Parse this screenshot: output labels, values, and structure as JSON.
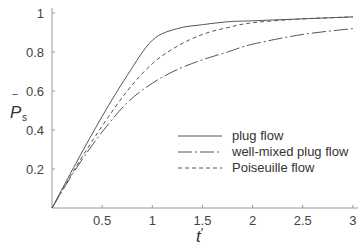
{
  "chart_data": {
    "type": "line",
    "title": "",
    "xlabel": "t'",
    "ylabel": "P̄s",
    "xlim": [
      0,
      3
    ],
    "ylim": [
      0,
      1
    ],
    "xticks": [
      0.5,
      1,
      1.5,
      2,
      2.5,
      3
    ],
    "yticks": [
      0.2,
      0.4,
      0.6,
      0.8,
      1
    ],
    "xtick_labels": [
      "0.5",
      "1",
      "1.5",
      "2",
      "2.5",
      "3"
    ],
    "ytick_labels": [
      "0.2",
      "0.4",
      "0.6",
      "0.8",
      "1"
    ],
    "grid": false,
    "legend_position": "center-right",
    "x": [
      0,
      0.25,
      0.5,
      0.75,
      1.0,
      1.25,
      1.5,
      1.75,
      2.0,
      2.5,
      3.0
    ],
    "series": [
      {
        "name": "plug flow",
        "style": "solid",
        "values": [
          0,
          0.24,
          0.47,
          0.68,
          0.86,
          0.92,
          0.94,
          0.955,
          0.96,
          0.97,
          0.98
        ]
      },
      {
        "name": "well-mixed plug flow",
        "style": "dash-dot",
        "values": [
          0,
          0.21,
          0.39,
          0.54,
          0.64,
          0.71,
          0.76,
          0.8,
          0.84,
          0.89,
          0.92
        ]
      },
      {
        "name": "Poiseuille flow",
        "style": "dashed",
        "values": [
          0,
          0.22,
          0.42,
          0.6,
          0.74,
          0.83,
          0.89,
          0.925,
          0.95,
          0.97,
          0.98
        ]
      }
    ]
  },
  "axes": {
    "x_label_main": "t",
    "x_label_prime": "′",
    "y_label_main": "P",
    "y_label_sub": "s",
    "y_label_bar": "‾"
  },
  "legend": {
    "items": [
      {
        "label": "plug flow"
      },
      {
        "label": "well-mixed plug flow"
      },
      {
        "label": "Poiseuille flow"
      }
    ]
  }
}
